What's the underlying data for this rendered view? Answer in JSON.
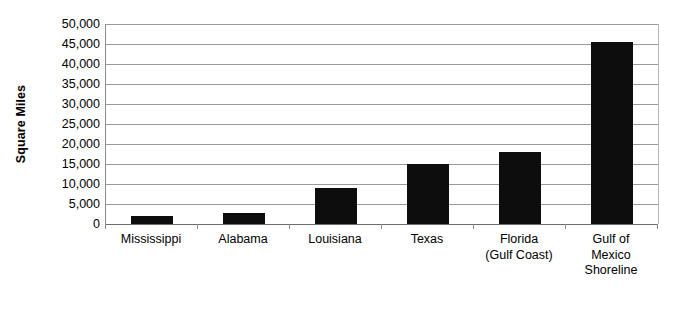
{
  "chart_data": {
    "type": "bar",
    "title": "",
    "subtitle": "",
    "xlabel": "",
    "ylabel": "Square Miles",
    "categories": [
      "Mississippi",
      "Alabama",
      "Louisiana",
      "Texas",
      "Florida (Gulf Coast)",
      "Gulf of Mexico Shoreline"
    ],
    "category_lines": [
      [
        "Mississippi"
      ],
      [
        "Alabama"
      ],
      [
        "Louisiana"
      ],
      [
        "Texas"
      ],
      [
        "Florida",
        "(Gulf Coast)"
      ],
      [
        "Gulf of",
        "Mexico",
        "Shoreline"
      ]
    ],
    "values": [
      1900,
      2800,
      9000,
      15000,
      17900,
      45500
    ],
    "ylim": [
      0,
      50000
    ],
    "ytick_values": [
      0,
      5000,
      10000,
      15000,
      20000,
      25000,
      30000,
      35000,
      40000,
      45000,
      50000
    ],
    "ytick_labels": [
      "0",
      "5,000",
      "10,000",
      "15,000",
      "20,000",
      "25,000",
      "30,000",
      "35,000",
      "40,000",
      "45,000",
      "50,000"
    ],
    "grid": true,
    "legend": false,
    "legend_position": "none",
    "bar_color": "#0d0d0d",
    "gridline_color": "#9a9a9a",
    "axis_color": "#8a8a8a",
    "background_color": "#ffffff"
  }
}
